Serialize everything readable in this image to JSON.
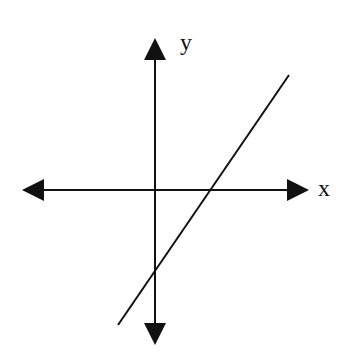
{
  "diagram": {
    "type": "coordinate-plane-with-line",
    "colors": {
      "background": "#ffffff",
      "stroke": "#111111"
    },
    "axes": {
      "x_label": "x",
      "y_label": "y"
    },
    "line": {
      "slope_sign": "positive",
      "x_intercept_sign": "positive",
      "y_intercept_sign": "negative"
    }
  }
}
